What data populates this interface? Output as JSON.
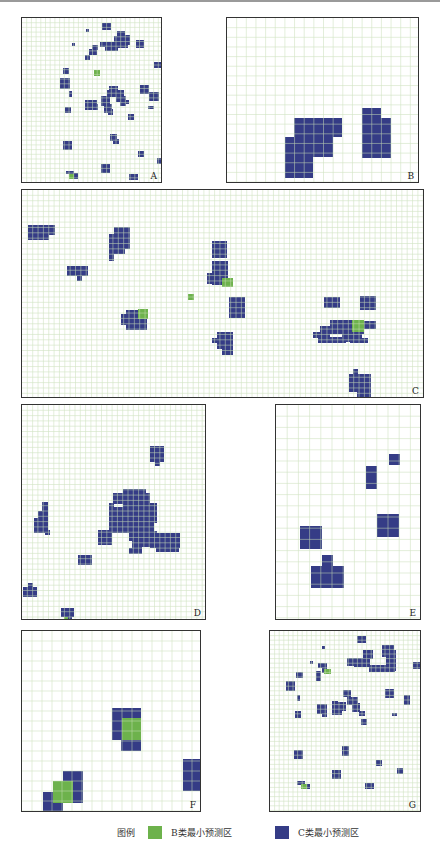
{
  "colors": {
    "b_class": "#6db24c",
    "c_class": "#353c86",
    "grid": "#c9dfb8",
    "border": "#333333"
  },
  "legend": {
    "title": "图例",
    "items": [
      {
        "label": "B类最小预测区",
        "color": "#6db24c"
      },
      {
        "label": "C类最小预测区",
        "color": "#353c86"
      }
    ]
  },
  "panels": [
    {
      "id": "A",
      "label": "A",
      "x": 21,
      "y": 17,
      "w": 141,
      "h": 166,
      "cell": 4.7,
      "c_blocks": [
        [
          80,
          5,
          9,
          7
        ],
        [
          64,
          11,
          3,
          3
        ],
        [
          95,
          13,
          8,
          5
        ],
        [
          100,
          13,
          2,
          4
        ],
        [
          92,
          18,
          14,
          9
        ],
        [
          84,
          24,
          22,
          6
        ],
        [
          103,
          17,
          5,
          10
        ],
        [
          78,
          24,
          10,
          5
        ],
        [
          50,
          25,
          3,
          3
        ],
        [
          70,
          27,
          6,
          5
        ],
        [
          67,
          31,
          8,
          6
        ],
        [
          63,
          37,
          5,
          5
        ],
        [
          83,
          26,
          13,
          7
        ],
        [
          114,
          22,
          8,
          8
        ],
        [
          132,
          44,
          7,
          6
        ],
        [
          41,
          50,
          6,
          6
        ],
        [
          38,
          60,
          10,
          11
        ],
        [
          47,
          73,
          3,
          6
        ],
        [
          87,
          68,
          9,
          10
        ],
        [
          85,
          72,
          17,
          7
        ],
        [
          94,
          78,
          10,
          6
        ],
        [
          98,
          82,
          6,
          6
        ],
        [
          118,
          67,
          9,
          9
        ],
        [
          127,
          74,
          10,
          9
        ],
        [
          140,
          74,
          6,
          8
        ],
        [
          63,
          82,
          12,
          10
        ],
        [
          70,
          86,
          6,
          6
        ],
        [
          79,
          78,
          9,
          10
        ],
        [
          82,
          86,
          8,
          9
        ],
        [
          86,
          91,
          5,
          6
        ],
        [
          43,
          89,
          6,
          6
        ],
        [
          106,
          96,
          6,
          6
        ],
        [
          126,
          88,
          6,
          3
        ],
        [
          100,
          82,
          7,
          4
        ],
        [
          41,
          123,
          9,
          9
        ],
        [
          88,
          116,
          7,
          7
        ],
        [
          91,
          121,
          6,
          5
        ],
        [
          116,
          133,
          6,
          6
        ],
        [
          135,
          140,
          6,
          6
        ],
        [
          79,
          146,
          9,
          9
        ],
        [
          44,
          153,
          8,
          3
        ],
        [
          52,
          155,
          4,
          6
        ],
        [
          107,
          156,
          9,
          6
        ]
      ],
      "b_blocks": [
        [
          72,
          52,
          6,
          6
        ],
        [
          47,
          156,
          5,
          5
        ]
      ]
    },
    {
      "id": "B",
      "label": "B",
      "x": 226,
      "y": 17,
      "w": 193,
      "h": 166,
      "cell": 9.65,
      "c_blocks": [
        [
          67,
          100,
          48,
          19
        ],
        [
          58,
          119,
          48,
          20
        ],
        [
          58,
          139,
          28,
          21
        ],
        [
          135,
          90,
          19,
          10
        ],
        [
          135,
          100,
          29,
          40
        ]
      ],
      "b_blocks": []
    },
    {
      "id": "C",
      "label": "C",
      "x": 21,
      "y": 189,
      "w": 403,
      "h": 209,
      "cell": 5.35,
      "c_blocks": [
        [
          6,
          35,
          27,
          10
        ],
        [
          6,
          45,
          21,
          5
        ],
        [
          45,
          76,
          21,
          10
        ],
        [
          55,
          86,
          5,
          5
        ],
        [
          92,
          37,
          16,
          22
        ],
        [
          87,
          44,
          5,
          27
        ],
        [
          92,
          59,
          11,
          5
        ],
        [
          104,
          120,
          16,
          20
        ],
        [
          99,
          124,
          5,
          11
        ],
        [
          120,
          125,
          5,
          15
        ],
        [
          190,
          51,
          15,
          17
        ],
        [
          190,
          71,
          16,
          24
        ],
        [
          185,
          83,
          7,
          11
        ],
        [
          207,
          107,
          16,
          21
        ],
        [
          195,
          142,
          16,
          17
        ],
        [
          190,
          148,
          10,
          5
        ],
        [
          200,
          159,
          11,
          6
        ],
        [
          302,
          107,
          16,
          11
        ],
        [
          302,
          110,
          10,
          7
        ],
        [
          338,
          106,
          16,
          14
        ],
        [
          308,
          130,
          34,
          14
        ],
        [
          298,
          136,
          10,
          10
        ],
        [
          291,
          142,
          17,
          6
        ],
        [
          296,
          147,
          28,
          6
        ],
        [
          320,
          143,
          20,
          9
        ],
        [
          342,
          131,
          12,
          8
        ],
        [
          328,
          148,
          18,
          5
        ],
        [
          327,
          184,
          22,
          18
        ],
        [
          331,
          179,
          5,
          5
        ],
        [
          335,
          202,
          14,
          5
        ]
      ],
      "b_blocks": [
        [
          116,
          119,
          10,
          10
        ],
        [
          200,
          88,
          11,
          9
        ],
        [
          166,
          104,
          6,
          6
        ],
        [
          330,
          130,
          12,
          12
        ]
      ]
    },
    {
      "id": "D",
      "label": "D",
      "x": 21,
      "y": 404,
      "w": 185,
      "h": 216,
      "cell": 5.3,
      "c_blocks": [
        [
          128,
          41,
          14,
          16
        ],
        [
          133,
          57,
          5,
          4
        ],
        [
          101,
          84,
          23,
          21
        ],
        [
          91,
          88,
          37,
          11
        ],
        [
          87,
          102,
          30,
          26
        ],
        [
          117,
          98,
          18,
          20
        ],
        [
          109,
          111,
          19,
          14
        ],
        [
          122,
          117,
          10,
          15
        ],
        [
          107,
          124,
          16,
          12
        ],
        [
          110,
          135,
          10,
          9
        ],
        [
          107,
          143,
          13,
          6
        ],
        [
          119,
          130,
          12,
          12
        ],
        [
          125,
          126,
          10,
          8
        ],
        [
          87,
          98,
          5,
          5
        ],
        [
          128,
          128,
          30,
          15
        ],
        [
          134,
          143,
          23,
          4
        ],
        [
          20,
          97,
          6,
          28
        ],
        [
          16,
          106,
          10,
          15
        ],
        [
          12,
          113,
          14,
          15
        ],
        [
          23,
          125,
          5,
          5
        ],
        [
          76,
          125,
          14,
          15
        ],
        [
          56,
          150,
          14,
          10
        ],
        [
          1,
          182,
          14,
          10
        ],
        [
          6,
          178,
          5,
          5
        ],
        [
          39,
          203,
          13,
          9
        ],
        [
          45,
          211,
          5,
          5
        ]
      ],
      "b_blocks": [
        [
          42,
          212,
          4,
          5
        ]
      ]
    },
    {
      "id": "E",
      "label": "E",
      "x": 275,
      "y": 404,
      "w": 146,
      "h": 216,
      "cell": 11.2,
      "c_blocks": [
        [
          113,
          49,
          11,
          11
        ],
        [
          90,
          61,
          11,
          23
        ],
        [
          101,
          109,
          22,
          23
        ],
        [
          24,
          121,
          22,
          23
        ],
        [
          46,
          150,
          11,
          11
        ],
        [
          35,
          161,
          33,
          22
        ]
      ],
      "b_blocks": []
    },
    {
      "id": "F",
      "label": "F",
      "x": 21,
      "y": 630,
      "w": 180,
      "h": 182,
      "cell": 10,
      "c_blocks": [
        [
          90,
          77,
          29,
          32
        ],
        [
          99,
          109,
          20,
          11
        ],
        [
          161,
          128,
          20,
          32
        ],
        [
          41,
          140,
          20,
          32
        ],
        [
          21,
          161,
          20,
          22
        ]
      ],
      "b_blocks": [
        [
          100,
          87,
          19,
          22
        ],
        [
          31,
          150,
          20,
          22
        ]
      ]
    },
    {
      "id": "G",
      "label": "G",
      "x": 269,
      "y": 630,
      "w": 152,
      "h": 182,
      "cell": 4.6,
      "c_blocks": [
        [
          87,
          5,
          9,
          7
        ],
        [
          52,
          15,
          3,
          3
        ],
        [
          93,
          19,
          10,
          9
        ],
        [
          77,
          27,
          10,
          8
        ],
        [
          84,
          27,
          16,
          9
        ],
        [
          99,
          34,
          26,
          7
        ],
        [
          112,
          14,
          12,
          12
        ],
        [
          116,
          19,
          10,
          21
        ],
        [
          40,
          30,
          3,
          3
        ],
        [
          48,
          32,
          9,
          5
        ],
        [
          52,
          37,
          5,
          5
        ],
        [
          46,
          40,
          5,
          10
        ],
        [
          26,
          41,
          7,
          6
        ],
        [
          16,
          50,
          9,
          10
        ],
        [
          27,
          64,
          3,
          6
        ],
        [
          143,
          31,
          7,
          7
        ],
        [
          73,
          59,
          8,
          7
        ],
        [
          77,
          66,
          11,
          8
        ],
        [
          82,
          72,
          8,
          9
        ],
        [
          89,
          80,
          6,
          5
        ],
        [
          68,
          71,
          8,
          9
        ],
        [
          115,
          58,
          9,
          9
        ],
        [
          134,
          64,
          6,
          10
        ],
        [
          47,
          73,
          10,
          10
        ],
        [
          52,
          78,
          5,
          8
        ],
        [
          62,
          70,
          6,
          14
        ],
        [
          66,
          76,
          6,
          8
        ],
        [
          25,
          80,
          6,
          7
        ],
        [
          122,
          82,
          5,
          3
        ],
        [
          91,
          88,
          6,
          6
        ],
        [
          72,
          115,
          7,
          10
        ],
        [
          24,
          119,
          9,
          9
        ],
        [
          106,
          129,
          6,
          6
        ],
        [
          127,
          137,
          6,
          6
        ],
        [
          62,
          139,
          9,
          9
        ],
        [
          27,
          150,
          8,
          4
        ],
        [
          36,
          153,
          4,
          5
        ],
        [
          95,
          152,
          9,
          6
        ]
      ],
      "b_blocks": [
        [
          54,
          38,
          7,
          5
        ],
        [
          31,
          153,
          6,
          5
        ]
      ]
    }
  ]
}
